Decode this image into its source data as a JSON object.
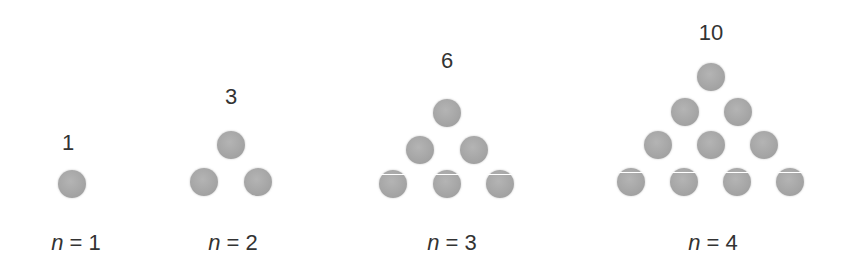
{
  "figures": [
    {
      "count": "1",
      "caption_var": "n",
      "caption_rest": " = 1",
      "balls": 1
    },
    {
      "count": "3",
      "caption_var": "n",
      "caption_rest": " = 2",
      "balls": 3
    },
    {
      "count": "6",
      "caption_var": "n",
      "caption_rest": " = 3",
      "balls": 6
    },
    {
      "count": "10",
      "caption_var": "n",
      "caption_rest": " = 4",
      "balls": 10
    }
  ],
  "colors": {
    "ball": "#a8a8a8",
    "text": "#333333",
    "background": "#ffffff"
  }
}
